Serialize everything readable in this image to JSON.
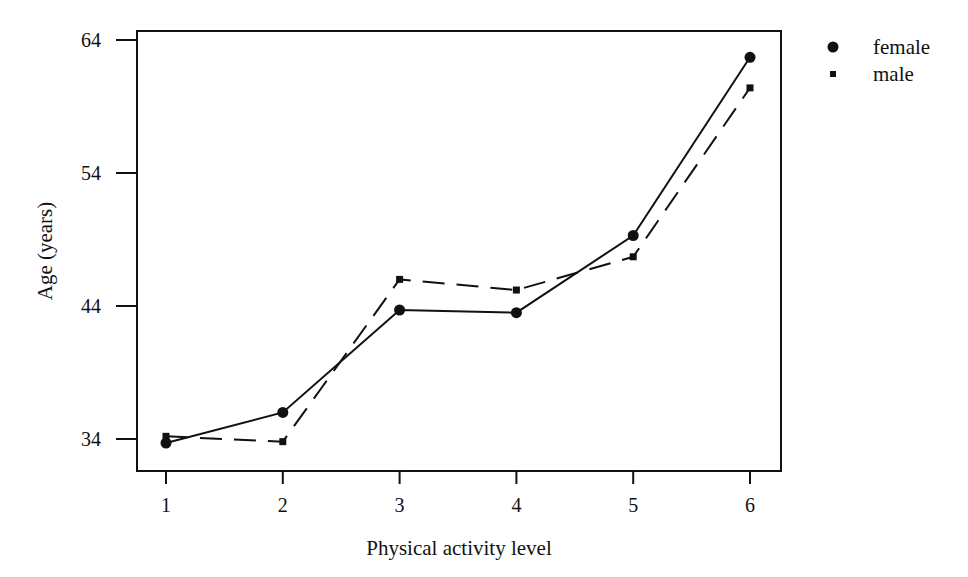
{
  "chart_data": {
    "type": "line",
    "title": "",
    "xlabel": "Physical activity level",
    "ylabel": "Age (years)",
    "x": [
      1,
      2,
      3,
      4,
      5,
      6
    ],
    "x_ticks": [
      "1",
      "2",
      "3",
      "4",
      "5",
      "6"
    ],
    "y_ticks": [
      "34",
      "44",
      "54",
      "64"
    ],
    "y_tick_values": [
      34,
      44,
      54,
      64
    ],
    "xlim": [
      0.75,
      6.27
    ],
    "ylim": [
      31.5,
      65
    ],
    "grid": false,
    "legend_position": "top-right-outside",
    "series": [
      {
        "name": "female",
        "marker": "circle",
        "line": "solid",
        "values": [
          33.7,
          36.0,
          43.7,
          43.5,
          49.3,
          62.7
        ]
      },
      {
        "name": "male",
        "marker": "square",
        "line": "dashed",
        "values": [
          34.2,
          33.8,
          46.0,
          45.2,
          47.7,
          60.4
        ]
      }
    ]
  },
  "colors": {
    "ink": "#111111",
    "background": "#ffffff"
  }
}
